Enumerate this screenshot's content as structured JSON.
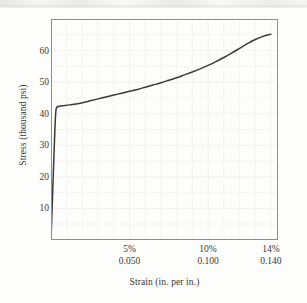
{
  "figure": {
    "background_color": "#fdfdfc",
    "frame_color": "#8e8d8b",
    "curve_color": "#3b3936",
    "grid_color": "#f0efee",
    "text_color": "#3a3836"
  },
  "chart_data": {
    "type": "line",
    "title": "",
    "subtitle": "",
    "xlabel": "Strain (in. per in.)",
    "ylabel": "Stress (thousand psi)",
    "xlim": [
      0,
      0.1445
    ],
    "ylim": [
      0,
      70
    ],
    "grid": true,
    "legend": null,
    "legend_position": "none",
    "x_tick_labels_percent": [
      "5%",
      "10%",
      "14%"
    ],
    "x_tick_labels_decimal": [
      "0.050",
      "0.100",
      "0.140"
    ],
    "x_tick_values": [
      0.05,
      0.1,
      0.14
    ],
    "y_tick_labels": [
      "10",
      "20",
      "30",
      "40",
      "50",
      "60"
    ],
    "y_tick_values": [
      10,
      20,
      30,
      40,
      50,
      60
    ],
    "series": [
      {
        "name": "stress-strain",
        "x": [
          0.0,
          0.0006,
          0.0012,
          0.0018,
          0.0024,
          0.0028,
          0.0031,
          0.0034,
          0.0038,
          0.0045,
          0.0055,
          0.007,
          0.009,
          0.012,
          0.016,
          0.02,
          0.025,
          0.03,
          0.035,
          0.04,
          0.045,
          0.05,
          0.055,
          0.06,
          0.065,
          0.07,
          0.075,
          0.08,
          0.085,
          0.09,
          0.095,
          0.1,
          0.105,
          0.11,
          0.115,
          0.12,
          0.125,
          0.13,
          0.135,
          0.14
        ],
        "y": [
          0.0,
          8.5,
          17.0,
          25.5,
          34.0,
          38.5,
          40.8,
          41.7,
          42.1,
          42.3,
          42.4,
          42.5,
          42.6,
          42.8,
          43.1,
          43.5,
          44.1,
          44.7,
          45.3,
          45.9,
          46.5,
          47.1,
          47.7,
          48.4,
          49.1,
          49.8,
          50.6,
          51.4,
          52.3,
          53.2,
          54.2,
          55.3,
          56.5,
          57.8,
          59.2,
          60.7,
          62.2,
          63.5,
          64.5,
          65.2
        ]
      }
    ],
    "annotations": [
      {
        "text": "elastic region",
        "x": 0.002,
        "y": 20
      },
      {
        "text": "yield plateau",
        "x": 0.01,
        "y": 42.4
      },
      {
        "text": "strain hardening",
        "x": 0.09,
        "y": 53
      }
    ]
  }
}
